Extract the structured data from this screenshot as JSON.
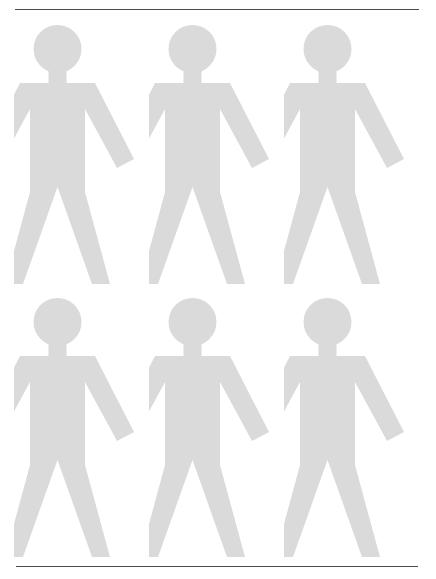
{
  "page": {
    "width": 436,
    "height": 579,
    "background_color": "#ffffff"
  },
  "rules": {
    "color": "#4a4a4a",
    "top": {
      "label": "top-divider-rule",
      "x": 15,
      "y": 9,
      "width": 404
    },
    "bottom": {
      "label": "bottom-divider-rule",
      "x": 16,
      "y": 566,
      "width": 402
    }
  },
  "pictogram": {
    "icon_name": "person-icon",
    "fill_color": "#dadada",
    "rows": 2,
    "columns": 3,
    "count": 6,
    "figure_width": 135,
    "figure_height": 265,
    "column_x": [
      14,
      149,
      284
    ],
    "row_y": [
      24,
      297
    ],
    "figures": [
      {
        "id": "person-1",
        "row": 0,
        "column": 0,
        "label": "Person 1"
      },
      {
        "id": "person-2",
        "row": 0,
        "column": 1,
        "label": "Person 2"
      },
      {
        "id": "person-3",
        "row": 0,
        "column": 2,
        "label": "Person 3"
      },
      {
        "id": "person-4",
        "row": 1,
        "column": 0,
        "label": "Person 4"
      },
      {
        "id": "person-5",
        "row": 1,
        "column": 1,
        "label": "Person 5"
      },
      {
        "id": "person-6",
        "row": 1,
        "column": 2,
        "label": "Person 6"
      }
    ]
  }
}
